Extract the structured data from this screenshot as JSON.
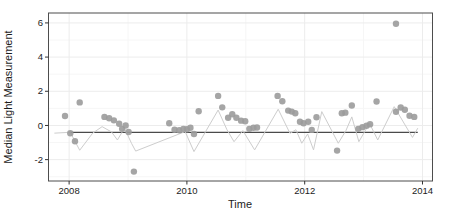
{
  "figure": {
    "xlabel": "Time",
    "ylabel": "Median Light Measurement"
  },
  "chart_data": {
    "type": "scatter",
    "title": "",
    "xlabel": "Time",
    "ylabel": "Median Light Measurement",
    "xlim": [
      2007.65,
      2014.17
    ],
    "ylim": [
      -3.25,
      6.58
    ],
    "x_ticks": [
      2008,
      2010,
      2012,
      2014
    ],
    "y_ticks": [
      -2,
      0,
      2,
      4,
      6
    ],
    "grid": "faint major and minor gridlines, white panel, dark panel border",
    "legend": "none",
    "series": [
      {
        "name": "monthly median points",
        "type": "scatter",
        "color": "#9b9b9b",
        "marker_radius": 3.2,
        "data": [
          [
            2007.93,
            0.55
          ],
          [
            2008.02,
            -0.46
          ],
          [
            2008.1,
            -0.92
          ],
          [
            2008.18,
            1.35
          ],
          [
            2008.6,
            0.5
          ],
          [
            2008.68,
            0.42
          ],
          [
            2008.76,
            0.3
          ],
          [
            2008.85,
            0.1
          ],
          [
            2008.9,
            -0.2
          ],
          [
            2008.96,
            0.0
          ],
          [
            2009.01,
            -0.38
          ],
          [
            2009.1,
            -2.7
          ],
          [
            2009.7,
            0.13
          ],
          [
            2009.79,
            -0.25
          ],
          [
            2009.87,
            -0.28
          ],
          [
            2009.94,
            -0.2
          ],
          [
            2010.0,
            -0.22
          ],
          [
            2010.06,
            -0.13
          ],
          [
            2010.12,
            -0.5
          ],
          [
            2010.2,
            0.83
          ],
          [
            2010.53,
            1.73
          ],
          [
            2010.6,
            1.06
          ],
          [
            2010.7,
            0.45
          ],
          [
            2010.77,
            0.66
          ],
          [
            2010.84,
            0.45
          ],
          [
            2010.92,
            0.28
          ],
          [
            2010.99,
            0.25
          ],
          [
            2011.06,
            -0.2
          ],
          [
            2011.13,
            -0.13
          ],
          [
            2011.19,
            -0.12
          ],
          [
            2011.54,
            1.73
          ],
          [
            2011.62,
            1.42
          ],
          [
            2011.72,
            0.87
          ],
          [
            2011.78,
            0.81
          ],
          [
            2011.84,
            0.71
          ],
          [
            2011.92,
            0.22
          ],
          [
            2011.98,
            0.13
          ],
          [
            2012.06,
            0.22
          ],
          [
            2012.12,
            -0.26
          ],
          [
            2012.2,
            0.48
          ],
          [
            2012.55,
            -1.47
          ],
          [
            2012.63,
            0.71
          ],
          [
            2012.69,
            0.75
          ],
          [
            2012.8,
            1.17
          ],
          [
            2012.91,
            -0.2
          ],
          [
            2012.98,
            -0.1
          ],
          [
            2013.05,
            -0.02
          ],
          [
            2013.11,
            0.07
          ],
          [
            2013.22,
            1.4
          ],
          [
            2013.55,
            5.95
          ],
          [
            2013.55,
            0.8
          ],
          [
            2013.63,
            1.05
          ],
          [
            2013.7,
            0.92
          ],
          [
            2013.78,
            0.57
          ],
          [
            2013.86,
            0.5
          ]
        ]
      },
      {
        "name": "connecting zigzag line",
        "type": "line",
        "color": "#cdcdcd",
        "width": 1,
        "data": [
          [
            2007.75,
            -0.45
          ],
          [
            2008.02,
            -0.4
          ],
          [
            2008.18,
            -1.45
          ],
          [
            2008.4,
            -0.45
          ],
          [
            2008.56,
            -0.07
          ],
          [
            2008.72,
            -0.38
          ],
          [
            2008.82,
            -0.85
          ],
          [
            2008.94,
            -0.16
          ],
          [
            2009.06,
            -1.05
          ],
          [
            2009.13,
            -1.5
          ],
          [
            2009.97,
            -0.36
          ],
          [
            2010.12,
            -1.53
          ],
          [
            2010.53,
            0.9
          ],
          [
            2010.68,
            -0.25
          ],
          [
            2010.8,
            -0.95
          ],
          [
            2010.95,
            -0.3
          ],
          [
            2011.15,
            -1.43
          ],
          [
            2011.55,
            0.95
          ],
          [
            2011.75,
            -0.46
          ],
          [
            2011.85,
            -0.25
          ],
          [
            2011.95,
            -1.04
          ],
          [
            2012.05,
            -0.5
          ],
          [
            2012.15,
            -1.43
          ],
          [
            2012.29,
            0.81
          ],
          [
            2012.57,
            -1.04
          ],
          [
            2012.7,
            -0.3
          ],
          [
            2012.8,
            0.5
          ],
          [
            2012.92,
            -0.95
          ],
          [
            2013.1,
            0.13
          ],
          [
            2013.24,
            -0.85
          ],
          [
            2013.52,
            1.1
          ],
          [
            2013.83,
            -0.7
          ],
          [
            2013.92,
            -0.16
          ]
        ]
      }
    ],
    "reference_line": {
      "name": "horizontal mean line",
      "y": -0.4,
      "x_start": 2008.0,
      "x_end": 2013.92,
      "color": "#4a4a4a",
      "width": 1.3
    }
  },
  "colors": {
    "background": "#ffffff",
    "panel_border": "#4d4d4d",
    "grid_major": "#ececec",
    "grid_minor": "#f6f6f6",
    "tick": "#333333",
    "point": "#9b9b9b",
    "zigzag_line": "#cdcdcd",
    "reference_line": "#4a4a4a"
  }
}
